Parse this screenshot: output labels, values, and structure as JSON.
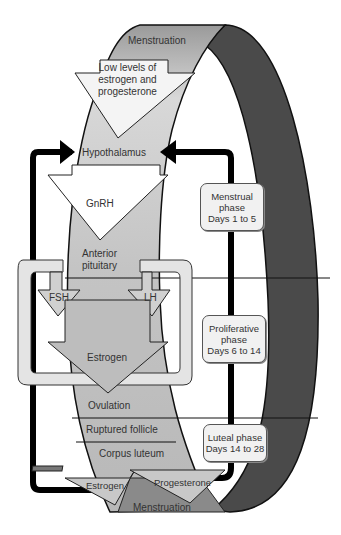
{
  "diagram": {
    "band_labels": {
      "top": "Menstruation",
      "low_levels": [
        "Low levels of",
        "estrogen and",
        "progesterone"
      ],
      "hypothalamus": "Hypothalamus",
      "gnrh": "GnRH",
      "anterior_pituitary": [
        "Anterior",
        "pituitary"
      ],
      "fsh": "FSH",
      "lh": "LH",
      "estrogen_mid": "Estrogen",
      "ovulation": "Ovulation",
      "ruptured_follicle": "Ruptured follicle",
      "corpus_luteum": "Corpus luteum",
      "estrogen_bottom": "Estrogen",
      "progesterone": "Progesterone",
      "bottom": "Menstruation"
    },
    "phases": [
      {
        "name": "Menstrual phase",
        "lines": [
          "Menstrual",
          "phase",
          "Days 1 to 5"
        ]
      },
      {
        "name": "Proliferative phase",
        "lines": [
          "Proliferative",
          "phase",
          "Days 6 to 14"
        ]
      },
      {
        "name": "Luteal phase",
        "lines": [
          "Luteal phase",
          "Days 14 to 28"
        ]
      }
    ],
    "colors": {
      "band_light": "#c8c8c8",
      "band_dark": "#4a4a4a",
      "arrow_white": "#ffffff",
      "box_fill": "#f1f1f1",
      "feedback_line": "#000000"
    }
  }
}
